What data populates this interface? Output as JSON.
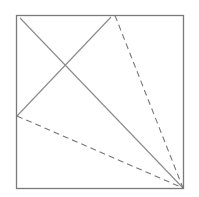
{
  "diagram": {
    "type": "geometric-figure",
    "colors": {
      "background": "#ffffff",
      "square_stroke": "#7a7a7a",
      "line_stroke": "#8a8a8a",
      "dashed_stroke": "#777777"
    },
    "square": {
      "x": 16.5,
      "y": 15.5,
      "width": 167,
      "height": 173
    },
    "solid_lines": [
      {
        "name": "main-diagonal",
        "x1": 20,
        "y1": 18,
        "x2": 183,
        "y2": 188
      },
      {
        "name": "cross-segment",
        "x1": 111,
        "y1": 17,
        "x2": 17,
        "y2": 116
      }
    ],
    "dashed_lines": [
      {
        "name": "dashed-top-to-corner",
        "x1": 115,
        "y1": 15.5,
        "x2": 183,
        "y2": 188
      },
      {
        "name": "dashed-left-to-corner",
        "x1": 17,
        "y1": 116,
        "x2": 183,
        "y2": 188
      }
    ]
  }
}
